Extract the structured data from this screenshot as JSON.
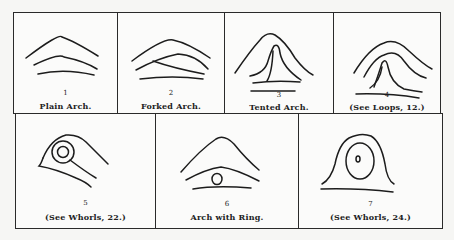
{
  "panels": [
    {
      "number": "1",
      "caption": "Plain Arch."
    },
    {
      "number": "2",
      "caption": "Forked Arch."
    },
    {
      "number": "3",
      "caption": "Tented Arch."
    },
    {
      "number": "4",
      "caption": "(See Loops, 12.)"
    },
    {
      "number": "5",
      "caption": "(See Whorls, 22.)"
    },
    {
      "number": "6",
      "caption": "Arch with Ring."
    },
    {
      "number": "7",
      "caption": "(See Whorls, 24.)"
    }
  ]
}
